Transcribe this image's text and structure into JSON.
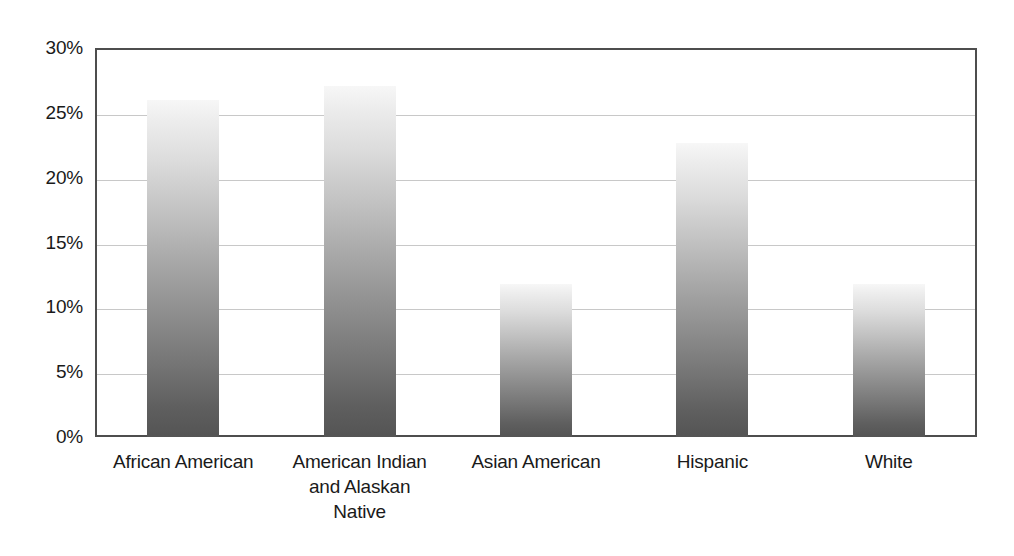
{
  "chart_data": {
    "type": "bar",
    "title": "",
    "subtitle": "",
    "xlabel": "",
    "ylabel": "",
    "categories": [
      "African American",
      "American Indian and Alaskan Native",
      "Asian American",
      "Hispanic",
      "White"
    ],
    "category_label_lines": [
      [
        "African American"
      ],
      [
        "American Indian",
        "and Alaskan",
        "Native"
      ],
      [
        "Asian American"
      ],
      [
        "Hispanic"
      ],
      [
        "White"
      ]
    ],
    "values": [
      26.0,
      27.1,
      11.8,
      22.7,
      11.8
    ],
    "value_labels": [
      "",
      "",
      "",
      "",
      ""
    ],
    "ylim": [
      0,
      30
    ],
    "ytick_values": [
      0,
      5,
      10,
      15,
      20,
      25,
      30
    ],
    "ytick_labels": [
      "0%",
      "5%",
      "10%",
      "15%",
      "20%",
      "25%",
      "30%"
    ],
    "grid": true,
    "grid_axis": "y",
    "legend": null,
    "legend_position": "none",
    "annotations": [],
    "colors": {
      "bar_gradient_top": "#f7f7f7",
      "bar_gradient_bottom": "#545454",
      "gridline": "#c8c8c8",
      "axis_border": "#4d4d4d",
      "text": "#1a1a1a",
      "background": "#ffffff"
    }
  }
}
